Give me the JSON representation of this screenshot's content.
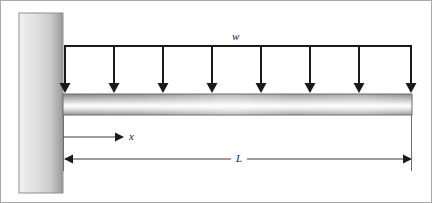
{
  "figure": {
    "type": "engineering-diagram",
    "background_color": "#ffffff",
    "border_color": "#a8a8a8",
    "width": 432,
    "height": 203
  },
  "labels": {
    "load_intensity": "w",
    "distance": "x",
    "length": "L"
  },
  "wall": {
    "name": "fixed-support-wall",
    "x": 18,
    "y": 12,
    "width": 44,
    "height": 180,
    "gradient_from": "#f2f2f2",
    "gradient_mid": "#d9d9d9",
    "gradient_to": "#9a9a9a",
    "outline_color": "#8c8c8c"
  },
  "beam": {
    "name": "cantilever-beam",
    "x": 62,
    "y": 93,
    "width": 349,
    "height": 21,
    "gradient_top": "#8e8e8e",
    "gradient_highlight": "#fdfdfd",
    "gradient_bottom": "#9c9c9c",
    "outline_color": "#6e6e6e"
  },
  "load": {
    "name": "uniform-distributed-load",
    "line_y": 45,
    "line_x_start": 63,
    "line_x_end": 411,
    "arrow_count": 8,
    "arrow_spacing": 48,
    "arrow_first_x": 63,
    "arrow_tip_y": 92,
    "color": "#1a1a1a",
    "line_width": 2
  },
  "dimensions": [
    {
      "name": "x-dimension",
      "label": "x",
      "y": 136,
      "x_start": 62,
      "x_end": 120,
      "arrow_heads": "right",
      "color": "#4a4a4a"
    },
    {
      "name": "L-dimension",
      "label": "L",
      "y": 158,
      "x_start": 63,
      "x_end": 411,
      "arrow_heads": "both",
      "color": "#4a4a4a"
    }
  ],
  "extension_lines": [
    {
      "name": "beam-left-extension",
      "x": 62,
      "y_start": 114,
      "y_end": 170
    },
    {
      "name": "beam-right-extension",
      "x": 411,
      "y_start": 114,
      "y_end": 170
    }
  ]
}
